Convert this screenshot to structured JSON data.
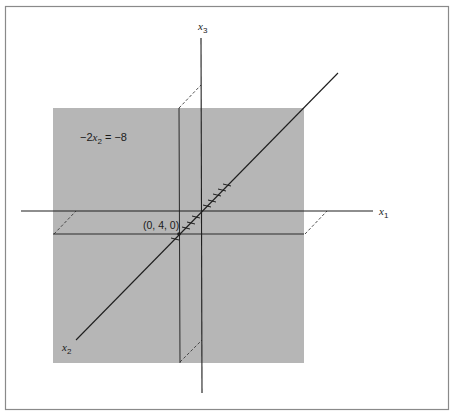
{
  "figure": {
    "colors": {
      "background": "#ffffff",
      "frame": "#8a8a8a",
      "plane": "#b6b6b6",
      "line": "#1e1e1e"
    },
    "labels": {
      "axis_x1": {
        "base": "x",
        "sub": "1"
      },
      "axis_x2": {
        "base": "x",
        "sub": "2"
      },
      "axis_x3": {
        "base": "x",
        "sub": "3"
      },
      "equation": {
        "prefix": "−2",
        "var": "x",
        "sub": "2",
        "suffix": " = −8"
      },
      "point": "(0, 4, 0)"
    },
    "plane": {
      "description": "plane -2x2 = -8 (x2 = 4)",
      "tick_count": 10
    }
  }
}
